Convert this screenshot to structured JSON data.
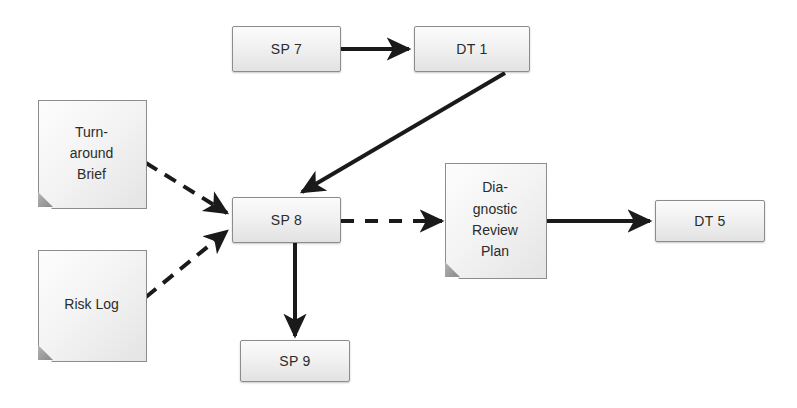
{
  "diagram": {
    "background_color": "#ffffff",
    "line_color": "#1a1a1a",
    "node_fill_top": "#fbfbfb",
    "node_fill_bottom": "#e2e2e2",
    "node_border_color": "#8c8c8c",
    "text_color": "#2b2b2b"
  },
  "nodes": {
    "sp7": {
      "label": "SP 7",
      "shape": "process-box"
    },
    "dt1": {
      "label": "DT 1",
      "shape": "process-box"
    },
    "sp8": {
      "label": "SP 8",
      "shape": "process-box"
    },
    "sp9": {
      "label": "SP 9",
      "shape": "process-box"
    },
    "dt5": {
      "label": "DT 5",
      "shape": "process-box"
    },
    "turnaround_brief": {
      "shape": "document",
      "lines": [
        "Turn-",
        "around",
        "Brief"
      ],
      "line1": "Turn-",
      "line2": "around",
      "line3": "Brief"
    },
    "risk_log": {
      "shape": "document",
      "lines": [
        "Risk Log"
      ],
      "line1": "Risk Log"
    },
    "diagnostic_review_plan": {
      "shape": "document",
      "lines": [
        "Dia-",
        "gnostic",
        "Review",
        "Plan"
      ],
      "line1": "Dia-",
      "line2": "gnostic",
      "line3": "Review",
      "line4": "Plan"
    }
  },
  "edges": [
    {
      "id": "sp7-to-dt1",
      "from": "SP 7",
      "to": "DT 1",
      "style": "solid",
      "label": ""
    },
    {
      "id": "dt1-to-sp8",
      "from": "DT 1",
      "to": "SP 8",
      "style": "solid",
      "label": ""
    },
    {
      "id": "turnaround-brief-to-sp8",
      "from": "Turn-around Brief",
      "to": "SP 8",
      "style": "dashed",
      "label": ""
    },
    {
      "id": "risk-log-to-sp8",
      "from": "Risk Log",
      "to": "SP 8",
      "style": "dashed",
      "label": ""
    },
    {
      "id": "sp8-to-diagnostic-review-plan",
      "from": "SP 8",
      "to": "Diagnostic Review Plan",
      "style": "dashed",
      "label": ""
    },
    {
      "id": "diagnostic-review-plan-to-dt5",
      "from": "Diagnostic Review Plan",
      "to": "DT 5",
      "style": "solid",
      "label": ""
    },
    {
      "id": "sp8-to-sp9",
      "from": "SP 8",
      "to": "SP 9",
      "style": "solid",
      "label": ""
    }
  ]
}
